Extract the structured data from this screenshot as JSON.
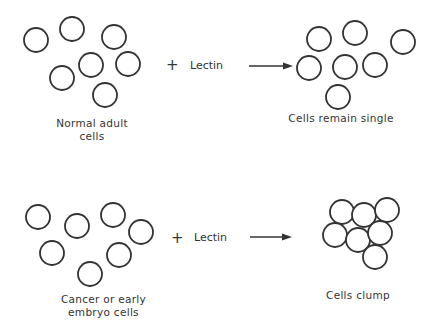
{
  "diagram": {
    "rows": [
      {
        "input_label_line1": "Normal adult",
        "input_label_line2": "cells",
        "plus": "+",
        "reagent": "Lectin",
        "result_label": "Cells remain single",
        "input_cells": [
          [
            36,
            40
          ],
          [
            72,
            29
          ],
          [
            114,
            37
          ],
          [
            91,
            65
          ],
          [
            128,
            64
          ],
          [
            62,
            78
          ],
          [
            105,
            95
          ]
        ],
        "result_cells": [
          [
            319,
            39
          ],
          [
            355,
            33
          ],
          [
            403,
            42
          ],
          [
            309,
            68
          ],
          [
            345,
            67
          ],
          [
            375,
            65
          ],
          [
            338,
            97
          ]
        ]
      },
      {
        "input_label_line1": "Cancer or early",
        "input_label_line2": "embryo cells",
        "plus": "+",
        "reagent": "Lectin",
        "result_label": "Cells clump",
        "input_cells": [
          [
            38,
            217
          ],
          [
            77,
            226
          ],
          [
            113,
            215
          ],
          [
            141,
            232
          ],
          [
            52,
            253
          ],
          [
            119,
            255
          ],
          [
            90,
            274
          ]
        ],
        "result_cells": [
          [
            342,
            212
          ],
          [
            364,
            215
          ],
          [
            387,
            210
          ],
          [
            335,
            235
          ],
          [
            358,
            240
          ],
          [
            380,
            233
          ],
          [
            375,
            257
          ]
        ]
      }
    ],
    "cell_radius": 12,
    "stroke_color": "#333333"
  }
}
